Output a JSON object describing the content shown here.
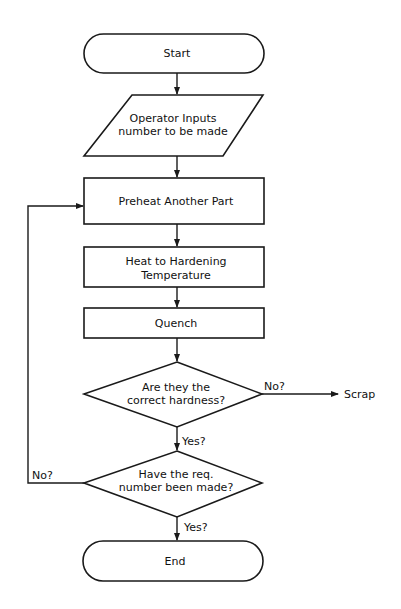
{
  "flowchart": {
    "nodes": {
      "start": {
        "type": "terminator",
        "label": "Start"
      },
      "input": {
        "type": "io",
        "line1": "Operator Inputs",
        "line2": "number to be made"
      },
      "preheat": {
        "type": "process",
        "label": "Preheat Another Part"
      },
      "heat": {
        "type": "process",
        "line1": "Heat to Hardening",
        "line2": "Temperature"
      },
      "quench": {
        "type": "process",
        "label": "Quench"
      },
      "hardness": {
        "type": "decision",
        "line1": "Are they the",
        "line2": "correct hardness?"
      },
      "count": {
        "type": "decision",
        "line1": "Have the req.",
        "line2": "number been made?"
      },
      "scrap": {
        "type": "terminal-text",
        "label": "Scrap"
      },
      "end": {
        "type": "terminator",
        "label": "End"
      }
    },
    "edges": {
      "hardness_no": "No?",
      "hardness_yes": "Yes?",
      "count_no": "No?",
      "count_yes": "Yes?"
    },
    "colors": {
      "stroke": "#1a1a1a",
      "fill": "#ffffff",
      "background": "#ffffff"
    }
  }
}
